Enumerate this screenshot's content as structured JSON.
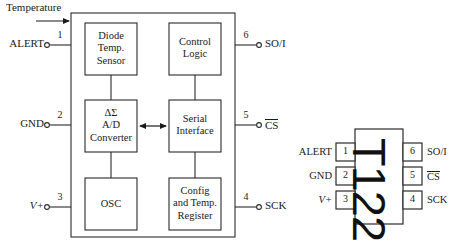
{
  "diagram": {
    "ink_color": "#1a1a1a",
    "background_color": "#ffffff"
  },
  "block_diagram": {
    "input_annotation": "Temperature",
    "blocks": [
      {
        "id": "diode-temp-sensor",
        "lines": [
          "Diode",
          "Temp.",
          "Sensor"
        ]
      },
      {
        "id": "control-logic",
        "lines": [
          "Control",
          "Logic"
        ]
      },
      {
        "id": "ad-converter",
        "lines": [
          "ΔΣ",
          "A/D",
          "Converter"
        ]
      },
      {
        "id": "serial-interface",
        "lines": [
          "Serial",
          "Interface"
        ]
      },
      {
        "id": "osc",
        "lines": [
          "OSC"
        ]
      },
      {
        "id": "config-temp-register",
        "lines": [
          "Config",
          "and Temp.",
          "Register"
        ]
      }
    ],
    "pins_left": [
      {
        "number": "1",
        "name": "ALERT",
        "overline": false,
        "italic": false
      },
      {
        "number": "2",
        "name": "GND",
        "overline": false,
        "italic": false
      },
      {
        "number": "3",
        "name": "V+",
        "overline": false,
        "italic": true
      }
    ],
    "pins_right": [
      {
        "number": "6",
        "name": "SO/I",
        "overline": false,
        "italic": false
      },
      {
        "number": "5",
        "name": "CS",
        "overline": true,
        "italic": false
      },
      {
        "number": "4",
        "name": "SCK",
        "overline": false,
        "italic": false
      }
    ]
  },
  "package_diagram": {
    "body_marking": "T122",
    "pins_left": [
      {
        "number": "1",
        "name": "ALERT",
        "overline": false,
        "italic": false
      },
      {
        "number": "2",
        "name": "GND",
        "overline": false,
        "italic": false
      },
      {
        "number": "3",
        "name": "V+",
        "overline": false,
        "italic": true
      }
    ],
    "pins_right": [
      {
        "number": "6",
        "name": "SO/I",
        "overline": false,
        "italic": false
      },
      {
        "number": "5",
        "name": "CS",
        "overline": true,
        "italic": false
      },
      {
        "number": "4",
        "name": "SCK",
        "overline": false,
        "italic": false
      }
    ]
  }
}
